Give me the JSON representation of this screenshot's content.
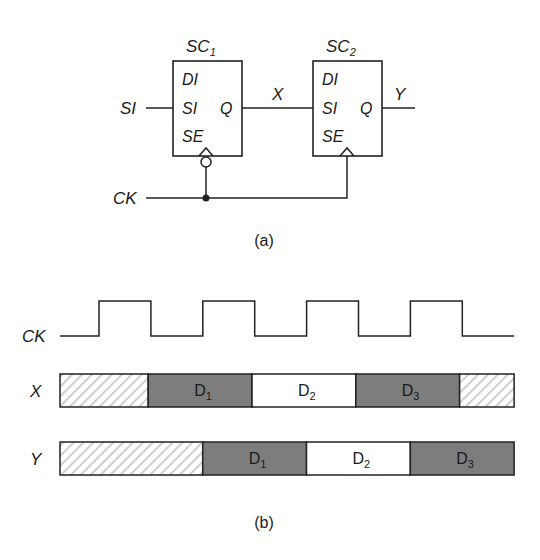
{
  "part_a": {
    "caption": "(a)",
    "cells": [
      {
        "name": "SC",
        "sub": "1",
        "pins_in": [
          "DI",
          "SI",
          "SE"
        ],
        "pin_out": "Q",
        "clock_inverted": true
      },
      {
        "name": "SC",
        "sub": "2",
        "pins_in": [
          "DI",
          "SI",
          "SE"
        ],
        "pin_out": "Q",
        "clock_inverted": false
      }
    ],
    "signals": {
      "input": "SI",
      "mid": "X",
      "output": "Y",
      "clock": "CK"
    }
  },
  "part_b": {
    "caption": "(b)",
    "clock_label": "CK",
    "clock_levels": [
      0,
      1,
      0,
      1,
      0,
      1,
      0,
      1,
      0
    ],
    "rows": [
      {
        "label": "X",
        "segments": [
          {
            "kind": "unknown",
            "label": "",
            "sub": "",
            "halves": 1.7
          },
          {
            "kind": "dark",
            "label": "D",
            "sub": "1",
            "halves": 2
          },
          {
            "kind": "light",
            "label": "D",
            "sub": "2",
            "halves": 2
          },
          {
            "kind": "dark",
            "label": "D",
            "sub": "3",
            "halves": 2
          },
          {
            "kind": "unknown",
            "label": "",
            "sub": "",
            "halves": 1.05
          }
        ]
      },
      {
        "label": "Y",
        "segments": [
          {
            "kind": "unknown",
            "label": "",
            "sub": "",
            "halves": 2.75
          },
          {
            "kind": "dark",
            "label": "D",
            "sub": "1",
            "halves": 2
          },
          {
            "kind": "light",
            "label": "D",
            "sub": "2",
            "halves": 2
          },
          {
            "kind": "dark",
            "label": "D",
            "sub": "3",
            "halves": 2
          }
        ]
      }
    ],
    "colors": {
      "dark": "#7d7d7d",
      "light": "#ffffff",
      "hatch": "#c8c8c8"
    }
  }
}
